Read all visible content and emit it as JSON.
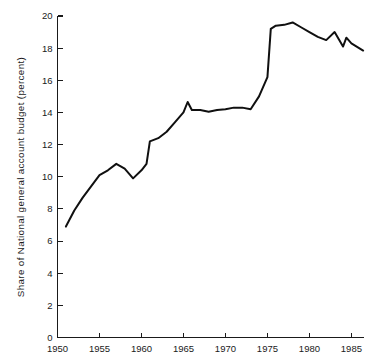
{
  "chart_data": {
    "type": "line",
    "title": "",
    "subtitle": "",
    "xlabel": "",
    "ylabel": "Share of National general account budget (percent)",
    "xlim": [
      1950,
      1986.5
    ],
    "ylim": [
      0,
      20
    ],
    "grid": false,
    "legend": null,
    "annotations": [],
    "x_ticks": [
      1950,
      1955,
      1960,
      1965,
      1970,
      1975,
      1980,
      1985
    ],
    "x_tick_labels": [
      "1950",
      "1955",
      "1960",
      "1965",
      "1970",
      "1975",
      "1980",
      "1985"
    ],
    "y_ticks": [
      0,
      2,
      4,
      6,
      8,
      10,
      12,
      14,
      16,
      18,
      20
    ],
    "y_tick_labels": [
      "0",
      "2",
      "4",
      "6",
      "8",
      "10",
      "12",
      "14",
      "16",
      "18",
      "20"
    ],
    "line_color": "#101010",
    "series": [
      {
        "name": "Share of National general account budget",
        "x": [
          1951,
          1952,
          1953,
          1954,
          1955,
          1956,
          1957,
          1958,
          1959,
          1960,
          1960.6,
          1961,
          1962,
          1963,
          1964,
          1965,
          1965.5,
          1966,
          1967,
          1968,
          1969,
          1970,
          1971,
          1972,
          1973,
          1974,
          1975,
          1975.4,
          1976,
          1977,
          1978,
          1979,
          1980,
          1981,
          1982,
          1983,
          1983.5,
          1984,
          1984.4,
          1985,
          1986.4
        ],
        "values": [
          6.9,
          7.9,
          8.7,
          9.4,
          10.1,
          10.4,
          10.8,
          10.5,
          9.9,
          10.4,
          10.8,
          12.2,
          12.4,
          12.8,
          13.4,
          14.0,
          14.65,
          14.15,
          14.15,
          14.05,
          14.15,
          14.2,
          14.3,
          14.3,
          14.2,
          15.0,
          16.2,
          19.2,
          19.4,
          19.45,
          19.6,
          19.3,
          19.0,
          18.7,
          18.5,
          19.0,
          18.55,
          18.1,
          18.65,
          18.3,
          17.85
        ]
      }
    ]
  },
  "axis": {
    "tick_direction": "inward",
    "frame": "L-shaped"
  }
}
